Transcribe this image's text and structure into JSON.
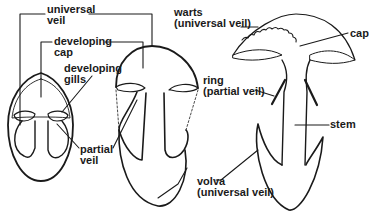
{
  "diagram": {
    "labels": {
      "universal_veil_1": "universal",
      "universal_veil_2": "veil",
      "developing_cap_1": "developing",
      "developing_cap_2": "cap",
      "developing_gills_1": "developing",
      "developing_gills_2": "gills",
      "partial_veil_1": "partial",
      "partial_veil_2": "veil",
      "warts_1": "warts",
      "warts_2": "(universal veil)",
      "cap": "cap",
      "ring_1": "ring",
      "ring_2": "(partial veil)",
      "stem": "stem",
      "volva_1": "volva",
      "volva_2": "(universal veil)"
    },
    "colors": {
      "stroke": "#1a1a1a",
      "background": "#ffffff"
    }
  }
}
